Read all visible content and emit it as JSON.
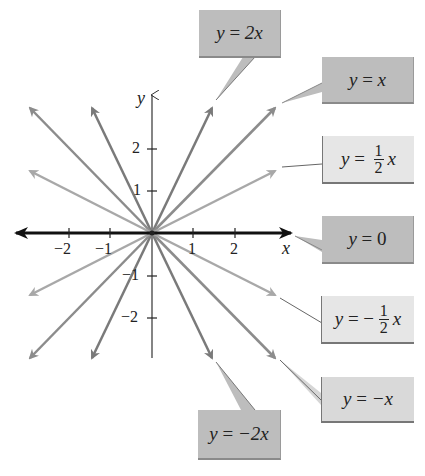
{
  "diagram": {
    "axes": {
      "x_label": "x",
      "y_label": "y",
      "x_ticks": [
        "−2",
        "−1",
        "1",
        "2"
      ],
      "y_ticks": [
        "2",
        "1",
        "−1",
        "−2"
      ]
    },
    "lines": [
      {
        "equation": "y = 2x",
        "slope": 2,
        "color": "#7a7a7a"
      },
      {
        "equation": "y = x",
        "slope": 1,
        "color": "#8c8c8c"
      },
      {
        "equation": "y = 1/2 x",
        "slope": 0.5,
        "color": "#a8a8a8"
      },
      {
        "equation": "y = 0",
        "slope": 0,
        "color": "#111111"
      },
      {
        "equation": "y = −1/2 x",
        "slope": -0.5,
        "color": "#a8a8a8"
      },
      {
        "equation": "y = −x",
        "slope": -1,
        "color": "#8c8c8c"
      },
      {
        "equation": "y = −2x",
        "slope": -2,
        "color": "#7a7a7a"
      }
    ],
    "labels": {
      "y2x": {
        "lhs": "y",
        "eq": " = ",
        "rhs": "2x"
      },
      "yx": {
        "lhs": "y",
        "eq": " = ",
        "rhs": "x"
      },
      "yhalfx": {
        "lhs": "y",
        "eq": " = ",
        "num": "1",
        "den": "2",
        "var": "x"
      },
      "y0": {
        "lhs": "y",
        "eq": " = ",
        "rhs": "0"
      },
      "yneghalfx": {
        "lhs": "y",
        "eq": " = − ",
        "num": "1",
        "den": "2",
        "var": "x"
      },
      "ynegx": {
        "lhs": "y",
        "eq": " = ",
        "rhs": "−x"
      },
      "yneg2x": {
        "lhs": "y",
        "eq": " = ",
        "rhs": "−2x"
      }
    }
  }
}
